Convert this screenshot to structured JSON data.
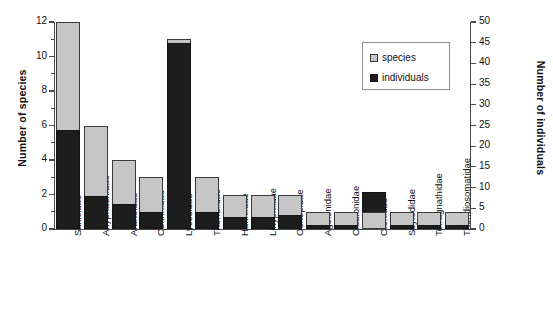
{
  "chart_data": {
    "type": "bar",
    "title": "",
    "subtitle": "",
    "xlabel": "",
    "ylabel": "Number of species",
    "y2label": "Number of individuals",
    "grid": false,
    "legend_position": "top-right",
    "bar_style": "overlaid dual-axis",
    "ylim": [
      0,
      12
    ],
    "y2lim": [
      0,
      50
    ],
    "yticks": [
      0,
      2,
      4,
      6,
      8,
      10,
      12
    ],
    "y2ticks": [
      0,
      5,
      10,
      15,
      20,
      25,
      30,
      35,
      40,
      45,
      50
    ],
    "categories": [
      "Salticidae",
      "Anyphaenidae",
      "Araneidae",
      "Corinnidae",
      "Lycosidae",
      "Theridiidae",
      "Hahniidae",
      "Linyphiidae",
      "Oonopidae",
      "Agelenidae",
      "Clubionidae",
      "Ctenidae",
      "Scytodidae",
      "Tetragnathidae",
      "Theridiosomatidae"
    ],
    "series": [
      {
        "name": "species",
        "axis": "left",
        "color": "#c6c6c6",
        "values": [
          12,
          6,
          4,
          3,
          11,
          3,
          2,
          2,
          2,
          1,
          1,
          1,
          1,
          1,
          1
        ]
      },
      {
        "name": "individuals",
        "axis": "right",
        "color": "#1d1d1d",
        "values": [
          24,
          8,
          6,
          4,
          45,
          4,
          3,
          3,
          3.5,
          1,
          1,
          9,
          1,
          1,
          1
        ]
      }
    ]
  },
  "legend": {
    "items": [
      {
        "label": "species",
        "swatch": "light-gray-square"
      },
      {
        "label": "individuals",
        "swatch": "black-square"
      }
    ]
  },
  "axes": {
    "left": {
      "title": "Number of species"
    },
    "right": {
      "title": "Number of individuals"
    }
  }
}
